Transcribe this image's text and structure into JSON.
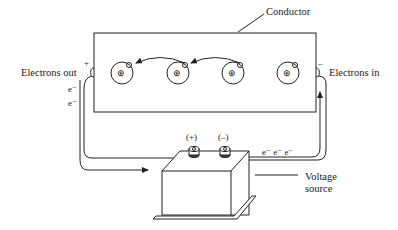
{
  "diagram": {
    "labels": {
      "conductor": "Conductor",
      "electrons_out": "Electrons out",
      "electrons_in": "Electrons in",
      "plus_terminal_mark": "+",
      "minus_terminal_mark": "–",
      "left_electrons": [
        "e⁻",
        "e⁻"
      ],
      "right_electrons": "e⁻ e⁻ e⁻",
      "battery_plus": "(+)",
      "battery_minus": "(–)",
      "voltage_source_line1": "Voltage",
      "voltage_source_line2": "source"
    },
    "atoms": [
      {
        "id": 1,
        "nucleus": "⊕"
      },
      {
        "id": 2,
        "nucleus": "⊕"
      },
      {
        "id": 3,
        "nucleus": "⊕"
      },
      {
        "id": 4,
        "nucleus": "⊕"
      }
    ],
    "colors": {
      "ink": "#222222",
      "background": "#ffffff"
    }
  }
}
